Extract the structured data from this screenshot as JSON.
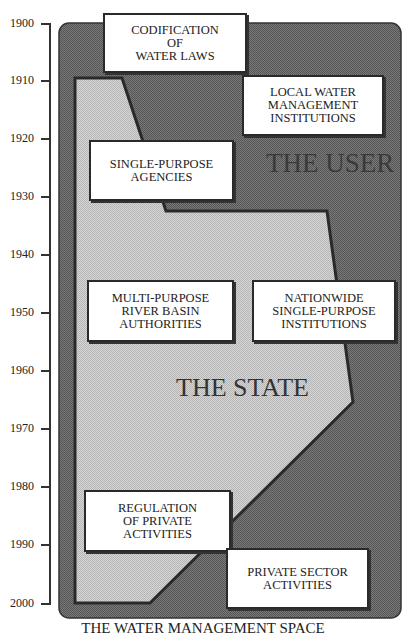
{
  "title": "THE WATER MANAGEMENT SPACE",
  "regions": {
    "user": "THE USER",
    "state": "THE STATE"
  },
  "timeline": {
    "ticks": [
      "1900",
      "1910",
      "1920",
      "1930",
      "1940",
      "1950",
      "1960",
      "1970",
      "1980",
      "1990",
      "2000"
    ]
  },
  "boxes": {
    "codification": "CODIFICATION\nOF\nWATER LAWS",
    "local": "LOCAL WATER\nMANAGEMENT\nINSTITUTIONS",
    "single_purpose": "SINGLE-PURPOSE\nAGENCIES",
    "multi_purpose": "MULTI-PURPOSE\nRIVER BASIN\nAUTHORITIES",
    "nationwide": "NATIONWIDE\nSINGLE-PURPOSE\nINSTITUTIONS",
    "regulation": "REGULATION\nOF PRIVATE\nACTIVITIES",
    "private_sector": "PRIVATE SECTOR\nACTIVITIES"
  },
  "colors": {
    "user_area": "#6b6b6b",
    "state_area": "#c9c9c9",
    "outline": "#2a2a2a"
  }
}
